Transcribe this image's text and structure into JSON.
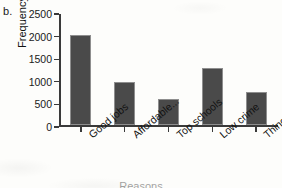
{
  "figure": {
    "panel_label": "b."
  },
  "chart_data": {
    "type": "bar",
    "title": "",
    "xlabel": "Reasons",
    "ylabel": "Frequency",
    "categories": [
      "Good jobs",
      "Affordable...",
      "Top schools",
      "Low crime",
      "Things to do"
    ],
    "values": [
      2000,
      950,
      590,
      1260,
      750
    ],
    "ylim": [
      0,
      2500
    ],
    "yticks": [
      0,
      500,
      1000,
      1500,
      2000,
      2500
    ],
    "ytick_labels": [
      "0",
      "500",
      "1000",
      "1500",
      "2000",
      "2500"
    ],
    "grid": false,
    "legend": null,
    "bar_color": "#4a4a4a",
    "bar_edge_color": "#8e8e8e",
    "axis_color": "#3a3a3a",
    "background_color": "#fdfdfb"
  }
}
